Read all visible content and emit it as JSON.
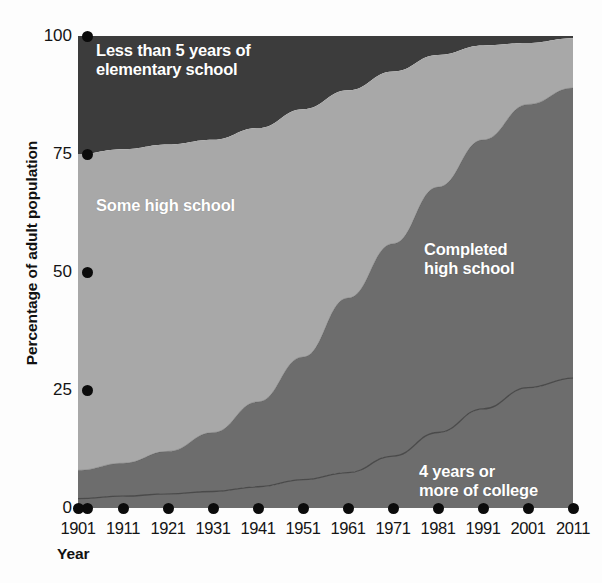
{
  "chart_data": {
    "type": "area",
    "stacked": true,
    "title": "",
    "xlabel": "Year",
    "ylabel": "Percentage of adult population",
    "x": [
      1901,
      1911,
      1921,
      1931,
      1941,
      1951,
      1961,
      1971,
      1981,
      1991,
      2001,
      2011
    ],
    "xtick_labels": [
      "1901",
      "1911",
      "1921",
      "1931",
      "1941",
      "1951",
      "1961",
      "1971",
      "1981",
      "1991",
      "2001",
      "2011"
    ],
    "ytick_labels": [
      "0",
      "25",
      "50",
      "75",
      "100"
    ],
    "ytick_values": [
      0,
      25,
      50,
      75,
      100
    ],
    "ylim": [
      0,
      100
    ],
    "grid": false,
    "legend_position": "inside-areas",
    "series": [
      {
        "name": "4 years or more of college",
        "color": "#6d6d6d",
        "values": [
          2,
          2.5,
          3,
          3.5,
          4.5,
          6,
          7.5,
          11,
          16,
          21,
          25.5,
          27.5
        ]
      },
      {
        "name": "Completed high school",
        "color": "#6d6d6d",
        "values": [
          6,
          7,
          9,
          12.5,
          18,
          26,
          37,
          45,
          52,
          57,
          60,
          61
        ]
      },
      {
        "name": "Some high school",
        "color": "#a8a8a8",
        "values": [
          67,
          66.5,
          65,
          62,
          58,
          52.5,
          44,
          36.5,
          28,
          20,
          13,
          11
        ]
      },
      {
        "name": "Less than 5 years of elementary school",
        "color": "#3c3c3c",
        "values": [
          25,
          24,
          23,
          22,
          19.5,
          15.5,
          11.5,
          7.5,
          4,
          2,
          1.5,
          0.5
        ]
      }
    ],
    "cumulative_tops": {
      "college": [
        2,
        2.5,
        3,
        3.5,
        4.5,
        6,
        7.5,
        11,
        16,
        21,
        25.5,
        27.5
      ],
      "completed_hs": [
        8,
        9.5,
        12,
        16,
        22.5,
        32,
        44.5,
        56,
        68,
        78,
        85.5,
        89
      ],
      "some_hs": [
        75,
        76,
        77,
        78,
        80.5,
        84.5,
        88.5,
        92.5,
        96,
        98,
        98.5,
        99.5
      ],
      "less_than_5": [
        100,
        100,
        100,
        100,
        100,
        100,
        100,
        100,
        100,
        100,
        100,
        100
      ]
    }
  },
  "axes": {
    "y_title": "Percentage of adult population",
    "x_title": "Year",
    "y_ticks": [
      {
        "label": "100"
      },
      {
        "label": "75"
      },
      {
        "label": "50"
      },
      {
        "label": "25"
      },
      {
        "label": "0"
      }
    ],
    "x_ticks": [
      {
        "label": "1901"
      },
      {
        "label": "1911"
      },
      {
        "label": "1921"
      },
      {
        "label": "1931"
      },
      {
        "label": "1941"
      },
      {
        "label": "1951"
      },
      {
        "label": "1961"
      },
      {
        "label": "1971"
      },
      {
        "label": "1981"
      },
      {
        "label": "1991"
      },
      {
        "label": "2001"
      },
      {
        "label": "2011"
      }
    ]
  },
  "band_labels": {
    "less_than_5": "Less than 5 years of\nelementary school",
    "some_high_school": "Some high school",
    "completed_high_school": "Completed\nhigh school",
    "four_years_college": "4 years or\nmore of college"
  },
  "colors": {
    "less_than_5": "#3c3c3c",
    "some_high_school": "#a8a8a8",
    "completed_high_school": "#6d6d6d",
    "four_years_college": "#6d6d6d",
    "divider_line": "#4a4a4a",
    "tick_dot": "#0b0b0b",
    "label_text": "#ffffff",
    "background": "#fdfdfd"
  }
}
